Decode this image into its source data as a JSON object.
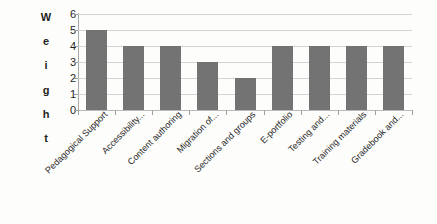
{
  "chart_data": {
    "type": "bar",
    "title": "",
    "xlabel": "",
    "ylabel": "Weight",
    "ylim": [
      0,
      6
    ],
    "yticks": [
      0,
      1,
      2,
      3,
      4,
      5,
      6
    ],
    "grid": true,
    "legend": "none",
    "bar_color": "#737373",
    "gridline_color": "#d3d3d3",
    "axis_color": "#a8a8a8",
    "categories": [
      "Pedagogical Support",
      "Accessibility...",
      "Content authoring",
      "Migration of...",
      "Sections and groups",
      "E-portfolio",
      "Testing and...",
      "Training materials",
      "Gradebook and..."
    ],
    "values": [
      5,
      4,
      4,
      3,
      2,
      4,
      4,
      4,
      4
    ]
  },
  "axis": {
    "y_title_letters": [
      "W",
      "e",
      "i",
      "g",
      "h",
      "t"
    ]
  }
}
